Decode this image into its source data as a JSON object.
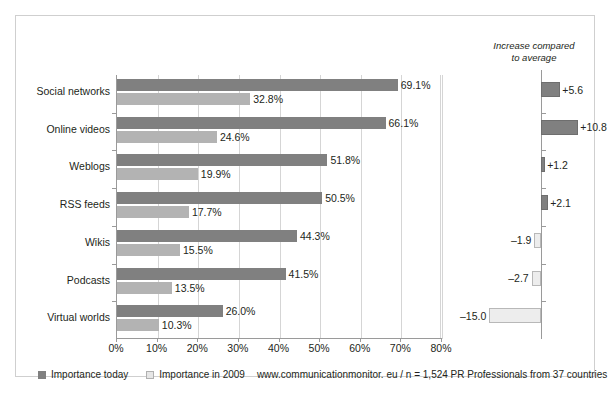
{
  "chart_data": {
    "type": "bar",
    "orientation": "horizontal",
    "title": "",
    "xlabel": "",
    "ylabel": "",
    "xlim": [
      0,
      80
    ],
    "grid": true,
    "xticks": [
      "0%",
      "10%",
      "20%",
      "30%",
      "40%",
      "50%",
      "60%",
      "70%",
      "80%"
    ],
    "xtick_values": [
      0,
      10,
      20,
      30,
      40,
      50,
      60,
      70,
      80
    ],
    "categories": [
      "Social networks",
      "Online videos",
      "Weblogs",
      "RSS feeds",
      "Wikis",
      "Podcasts",
      "Virtual worlds"
    ],
    "series": [
      {
        "name": "Importance today",
        "color": "#808080",
        "values": [
          69.1,
          66.1,
          51.8,
          50.5,
          44.3,
          41.5,
          26.0
        ],
        "labels": [
          "69.1%",
          "66.1%",
          "51.8%",
          "50.5%",
          "44.3%",
          "41.5%",
          "26.0%"
        ]
      },
      {
        "name": "Importance in 2009",
        "color": "#b3b3b3",
        "values": [
          32.8,
          24.6,
          19.9,
          17.7,
          15.5,
          13.5,
          10.3
        ],
        "labels": [
          "32.8%",
          "24.6%",
          "19.9%",
          "17.7%",
          "15.5%",
          "13.5%",
          "10.3%"
        ]
      }
    ],
    "legend": {
      "position": "bottom-left",
      "entries": [
        "Importance today",
        "Importance in 2009"
      ]
    },
    "source_note": "www.communicationmonitor. eu / n = 1,524 PR Professionals from 37 countries",
    "secondary_panel": {
      "title_line1": "Increase compared",
      "title_line2": "to average",
      "type": "bar",
      "orientation": "horizontal",
      "categories": [
        "Social networks",
        "Online videos",
        "Weblogs",
        "RSS feeds",
        "Wikis",
        "Podcasts",
        "Virtual worlds"
      ],
      "values": [
        5.6,
        10.8,
        1.2,
        2.1,
        -1.9,
        -2.7,
        -15.0
      ],
      "labels": [
        "+5.6",
        "+10.8",
        "+1.2",
        "+2.1",
        "–1.9",
        "–2.7",
        "–15.0"
      ],
      "positive_color": "#808080",
      "negative_color": "#ededed",
      "zero_line": 0
    }
  },
  "legend": {
    "today_label": "Importance today",
    "prev_label": "Importance in 2009",
    "source": "www.communicationmonitor. eu / n = 1,524 PR Professionals from 37 countries"
  },
  "right_panel": {
    "title_line1": "Increase compared",
    "title_line2": "to average"
  }
}
